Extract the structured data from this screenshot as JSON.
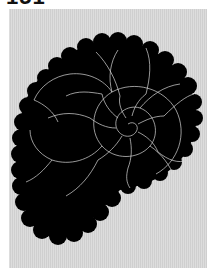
{
  "page": {
    "number_label": "151"
  },
  "figure": {
    "background_color": "#d6d6d6",
    "shell_color": "#000000",
    "suture_color": "#d9d9d9"
  }
}
